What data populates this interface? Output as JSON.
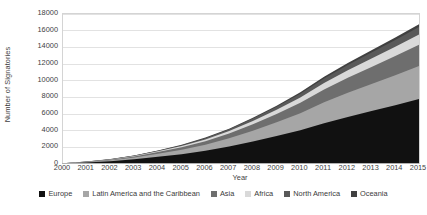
{
  "chart_data": {
    "type": "area",
    "stacked": true,
    "title": "",
    "xlabel": "Year",
    "ylabel": "Number of Signatories",
    "categories": [
      "2000",
      "2001",
      "2002",
      "2003",
      "2004",
      "2005",
      "2006",
      "2007",
      "2008",
      "2009",
      "2010",
      "2011",
      "2012",
      "2013",
      "2014",
      "2015"
    ],
    "x": [
      2000,
      2001,
      2002,
      2003,
      2004,
      2005,
      2006,
      2007,
      2008,
      2009,
      2010,
      2011,
      2012,
      2013,
      2014,
      2015
    ],
    "ylim": [
      0,
      18000
    ],
    "ytick_values": [
      0,
      2000,
      4000,
      6000,
      8000,
      10000,
      12000,
      14000,
      16000,
      18000
    ],
    "ytick_labels": [
      "0",
      "2000",
      "4000",
      "6000",
      "8000",
      "10000",
      "12000",
      "14000",
      "16000",
      "18000"
    ],
    "grid": true,
    "grid_axis": "y",
    "legend_position": "bottom",
    "series": [
      {
        "name": "Europe",
        "color": "#111111",
        "values": [
          60,
          170,
          330,
          560,
          860,
          1180,
          1600,
          2100,
          2700,
          3350,
          4050,
          4900,
          5650,
          6350,
          7050,
          7800
        ]
      },
      {
        "name": "Latin America and the Caribbean",
        "color": "#a6a6a6",
        "values": [
          20,
          60,
          120,
          220,
          360,
          520,
          720,
          980,
          1300,
          1650,
          2050,
          2500,
          2900,
          3250,
          3600,
          3950
        ]
      },
      {
        "name": "Asia",
        "color": "#6e6e6e",
        "values": [
          10,
          30,
          70,
          130,
          210,
          300,
          420,
          580,
          780,
          1000,
          1250,
          1550,
          1800,
          2050,
          2300,
          2550
        ]
      },
      {
        "name": "Africa",
        "color": "#d9d9d9",
        "values": [
          5,
          15,
          35,
          60,
          100,
          150,
          210,
          290,
          390,
          500,
          620,
          760,
          890,
          1010,
          1130,
          1250
        ]
      },
      {
        "name": "North America",
        "color": "#595959",
        "values": [
          5,
          12,
          25,
          45,
          75,
          110,
          155,
          210,
          280,
          360,
          450,
          550,
          640,
          720,
          800,
          880
        ]
      },
      {
        "name": "Oceania",
        "color": "#404040",
        "values": [
          2,
          5,
          10,
          18,
          30,
          45,
          62,
          85,
          112,
          142,
          176,
          214,
          248,
          280,
          312,
          345
        ]
      }
    ],
    "totals": [
      102,
      292,
      590,
      1033,
      1635,
      2305,
      3167,
      4245,
      5562,
      7002,
      8596,
      10474,
      12128,
      13660,
      15192,
      16775
    ]
  },
  "axes": {
    "y_title": "Number of Signatories",
    "x_title": "Year"
  },
  "legend": {
    "items": [
      {
        "label": "Europe",
        "color": "#111111"
      },
      {
        "label": "Latin America and the Caribbean",
        "color": "#a6a6a6"
      },
      {
        "label": "Asia",
        "color": "#6e6e6e"
      },
      {
        "label": "Africa",
        "color": "#d9d9d9"
      },
      {
        "label": "North America",
        "color": "#595959"
      },
      {
        "label": "Oceania",
        "color": "#404040"
      }
    ]
  },
  "style": {
    "background": "#ffffff",
    "gridline_color": "#e2e2e2",
    "axis_line_color": "#b0b0b0",
    "text_color": "#3a3a3a"
  }
}
